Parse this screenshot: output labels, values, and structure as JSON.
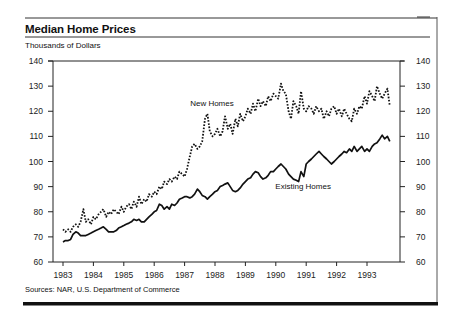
{
  "header": {
    "title": "Median Home Prices",
    "subtitle": "Thousands of Dollars"
  },
  "footer": {
    "source": "Sources: NAR, U.S. Department of Commerce"
  },
  "colors": {
    "ink": "#111111",
    "background": "#ffffff"
  },
  "chart_data": {
    "type": "line",
    "title": "Median Home Prices",
    "subtitle": "Thousands of Dollars",
    "xlabel": "",
    "ylabel": "Thousands of Dollars",
    "ylim": [
      60,
      140
    ],
    "yticks": [
      60,
      70,
      80,
      90,
      100,
      110,
      120,
      130,
      140
    ],
    "xticks": [
      "1983",
      "1984",
      "1985",
      "1986",
      "1987",
      "1988",
      "1989",
      "1990",
      "1991",
      "1992",
      "1993"
    ],
    "xlim": [
      1982.67,
      1994.1
    ],
    "grid": false,
    "dual_y_axis": true,
    "legend": "inline labels",
    "annotations": [
      {
        "text": "New Homes",
        "x": 1987.9,
        "y": 122
      },
      {
        "text": "Existing Homes",
        "x": 1990.9,
        "y": 89
      }
    ],
    "series": [
      {
        "name": "New Homes",
        "style": "dotted",
        "x": [
          1983.0,
          1983.08,
          1983.17,
          1983.25,
          1983.33,
          1983.42,
          1983.5,
          1983.58,
          1983.67,
          1983.75,
          1983.83,
          1983.92,
          1984.0,
          1984.08,
          1984.17,
          1984.25,
          1984.33,
          1984.42,
          1984.5,
          1984.58,
          1984.67,
          1984.75,
          1984.83,
          1984.92,
          1985.0,
          1985.08,
          1985.17,
          1985.25,
          1985.33,
          1985.42,
          1985.5,
          1985.58,
          1985.67,
          1985.75,
          1985.83,
          1985.92,
          1986.0,
          1986.08,
          1986.17,
          1986.25,
          1986.33,
          1986.42,
          1986.5,
          1986.58,
          1986.67,
          1986.75,
          1986.83,
          1986.92,
          1987.0,
          1987.08,
          1987.17,
          1987.25,
          1987.33,
          1987.42,
          1987.5,
          1987.58,
          1987.67,
          1987.75,
          1987.83,
          1987.92,
          1988.0,
          1988.08,
          1988.17,
          1988.25,
          1988.33,
          1988.42,
          1988.5,
          1988.58,
          1988.67,
          1988.75,
          1988.83,
          1988.92,
          1989.0,
          1989.08,
          1989.17,
          1989.25,
          1989.33,
          1989.42,
          1989.5,
          1989.58,
          1989.67,
          1989.75,
          1989.83,
          1989.92,
          1990.0,
          1990.08,
          1990.17,
          1990.25,
          1990.33,
          1990.42,
          1990.5,
          1990.58,
          1990.67,
          1990.75,
          1990.83,
          1990.92,
          1991.0,
          1991.08,
          1991.17,
          1991.25,
          1991.33,
          1991.42,
          1991.5,
          1991.58,
          1991.67,
          1991.75,
          1991.83,
          1991.92,
          1992.0,
          1992.08,
          1992.17,
          1992.25,
          1992.33,
          1992.42,
          1992.5,
          1992.58,
          1992.67,
          1992.75,
          1992.83,
          1992.92,
          1993.0,
          1993.08,
          1993.17,
          1993.25,
          1993.33,
          1993.42,
          1993.5,
          1993.58,
          1993.67,
          1993.75
        ],
        "values": [
          73,
          72,
          73,
          72,
          74,
          75,
          74,
          76,
          81,
          76,
          77,
          75,
          78,
          77,
          79,
          80,
          81,
          78,
          80,
          79,
          81,
          80,
          79,
          82,
          80,
          82,
          83,
          81,
          84,
          82,
          86,
          83,
          85,
          84,
          87,
          86,
          88,
          87,
          90,
          89,
          92,
          91,
          93,
          92,
          94,
          93,
          96,
          95,
          94,
          97,
          102,
          106,
          107,
          105,
          106,
          108,
          117,
          119,
          112,
          110,
          111,
          113,
          110,
          112,
          118,
          113,
          115,
          111,
          117,
          114,
          119,
          116,
          118,
          121,
          119,
          123,
          120,
          125,
          122,
          124,
          122,
          126,
          124,
          127,
          126,
          125,
          131,
          128,
          127,
          120,
          117,
          124,
          122,
          119,
          128,
          121,
          120,
          122,
          121,
          119,
          122,
          120,
          121,
          117,
          120,
          118,
          121,
          122,
          119,
          121,
          118,
          121,
          119,
          117,
          116,
          121,
          119,
          122,
          121,
          126,
          123,
          128,
          126,
          124,
          130,
          127,
          125,
          127,
          129,
          122
        ]
      },
      {
        "name": "Existing Homes",
        "style": "solid",
        "x": [
          1983.0,
          1983.08,
          1983.17,
          1983.25,
          1983.33,
          1983.42,
          1983.5,
          1983.58,
          1983.67,
          1983.75,
          1983.83,
          1983.92,
          1984.0,
          1984.08,
          1984.17,
          1984.25,
          1984.33,
          1984.42,
          1984.5,
          1984.58,
          1984.67,
          1984.75,
          1984.83,
          1984.92,
          1985.0,
          1985.08,
          1985.17,
          1985.25,
          1985.33,
          1985.42,
          1985.5,
          1985.58,
          1985.67,
          1985.75,
          1985.83,
          1985.92,
          1986.0,
          1986.08,
          1986.17,
          1986.25,
          1986.33,
          1986.42,
          1986.5,
          1986.58,
          1986.67,
          1986.75,
          1986.83,
          1986.92,
          1987.0,
          1987.08,
          1987.17,
          1987.25,
          1987.33,
          1987.42,
          1987.5,
          1987.58,
          1987.67,
          1987.75,
          1987.83,
          1987.92,
          1988.0,
          1988.08,
          1988.17,
          1988.25,
          1988.33,
          1988.42,
          1988.5,
          1988.58,
          1988.67,
          1988.75,
          1988.83,
          1988.92,
          1989.0,
          1989.08,
          1989.17,
          1989.25,
          1989.33,
          1989.42,
          1989.5,
          1989.58,
          1989.67,
          1989.75,
          1989.83,
          1989.92,
          1990.0,
          1990.08,
          1990.17,
          1990.25,
          1990.33,
          1990.42,
          1990.5,
          1990.58,
          1990.67,
          1990.75,
          1990.83,
          1990.92,
          1991.0,
          1991.08,
          1991.17,
          1991.25,
          1991.33,
          1991.42,
          1991.5,
          1991.58,
          1991.67,
          1991.75,
          1991.83,
          1991.92,
          1992.0,
          1992.08,
          1992.17,
          1992.25,
          1992.33,
          1992.42,
          1992.5,
          1992.58,
          1992.67,
          1992.75,
          1992.83,
          1992.92,
          1993.0,
          1993.08,
          1993.17,
          1993.25,
          1993.33,
          1993.42,
          1993.5,
          1993.58,
          1993.67,
          1993.75
        ],
        "values": [
          68,
          68.5,
          68.5,
          69,
          71,
          72,
          71.5,
          70.5,
          70.5,
          70.5,
          71,
          71.5,
          72,
          72.5,
          73,
          73.5,
          74,
          73,
          72,
          72,
          72,
          72.5,
          73.5,
          74,
          74.5,
          75,
          75.5,
          76,
          77,
          76.5,
          77,
          76,
          76,
          77,
          78,
          79,
          80,
          80.5,
          83,
          82.5,
          81,
          82,
          81,
          83,
          82.5,
          83.5,
          85,
          85.5,
          86,
          86,
          85.5,
          86,
          87,
          89,
          88,
          86.5,
          86,
          85,
          86,
          87,
          88,
          88.5,
          90,
          90.5,
          91,
          91.5,
          90,
          88.5,
          88,
          88.5,
          89.5,
          91,
          92,
          93,
          93.5,
          95,
          96,
          95.5,
          94,
          93,
          93.5,
          94.5,
          96,
          96,
          97,
          98,
          99,
          98,
          97,
          95,
          94,
          93,
          92.5,
          92,
          96,
          94,
          99,
          100,
          101,
          102,
          103,
          104,
          103,
          102,
          101,
          100,
          99,
          100,
          101,
          102,
          103,
          104,
          103.5,
          105,
          104,
          106,
          104,
          105,
          106,
          104,
          105,
          104,
          106,
          107,
          107.5,
          109,
          110.5,
          109,
          110,
          108
        ]
      }
    ]
  }
}
